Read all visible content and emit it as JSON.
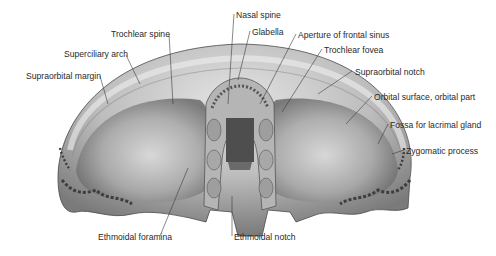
{
  "figure": {
    "colors": {
      "bone_light": "#d9d9d9",
      "bone_mid": "#a8a8a8",
      "bone_dark": "#5a5a5a",
      "label": "#2a2a2a",
      "leader": "#3a3a3a"
    }
  },
  "labels": [
    {
      "id": "nasal-spine",
      "text": "Nasal spine",
      "x": 236,
      "y": 10
    },
    {
      "id": "trochlear-spine",
      "text": "Trochlear spine",
      "x": 111,
      "y": 29
    },
    {
      "id": "glabella",
      "text": "Glabella",
      "x": 252,
      "y": 27
    },
    {
      "id": "aperture-frontal-sinus",
      "text": "Aperture of frontal sinus",
      "x": 298,
      "y": 30
    },
    {
      "id": "trochlear-fovea",
      "text": "Trochlear fovea",
      "x": 324,
      "y": 45
    },
    {
      "id": "superciliary-arch",
      "text": "Superciliary arch",
      "x": 64,
      "y": 49
    },
    {
      "id": "supraorbital-notch",
      "text": "Supraorbital notch",
      "x": 355,
      "y": 67
    },
    {
      "id": "supraorbital-margin",
      "text": "Supraorbital margin",
      "x": 26,
      "y": 71
    },
    {
      "id": "orbital-surface",
      "text": "Orbital surface, orbital part",
      "x": 374,
      "y": 92
    },
    {
      "id": "fossa-lacrimal-gland",
      "text": "Fossa for lacrimal gland",
      "x": 390,
      "y": 120
    },
    {
      "id": "zygomatic-process",
      "text": "Zygomatic process",
      "x": 406,
      "y": 146
    },
    {
      "id": "ethmoidal-foramina",
      "text": "Ethmoidal foramina",
      "x": 98,
      "y": 232
    },
    {
      "id": "ethmoidal-notch",
      "text": "Ethmoidal notch",
      "x": 234,
      "y": 232
    }
  ]
}
